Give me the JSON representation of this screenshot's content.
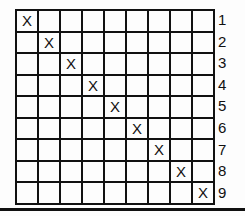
{
  "grid": {
    "rows": 9,
    "cols": 9,
    "marker": "X",
    "marks": [
      {
        "row": 1,
        "col": 1
      },
      {
        "row": 2,
        "col": 2
      },
      {
        "row": 3,
        "col": 3
      },
      {
        "row": 4,
        "col": 4
      },
      {
        "row": 5,
        "col": 5
      },
      {
        "row": 6,
        "col": 6
      },
      {
        "row": 7,
        "col": 7
      },
      {
        "row": 8,
        "col": 8
      },
      {
        "row": 9,
        "col": 9
      }
    ]
  },
  "row_labels": [
    "1",
    "2",
    "3",
    "4",
    "5",
    "6",
    "7",
    "8",
    "9"
  ]
}
